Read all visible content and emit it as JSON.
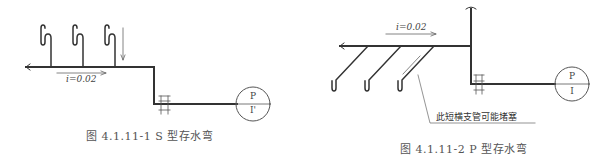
{
  "figures": [
    {
      "id": "s-trap",
      "caption": "图 4.1.11-1   S 型存水弯",
      "slope_label": "i=0.02",
      "circle_top": "P",
      "circle_bottom": "I'",
      "trap_count": 3
    },
    {
      "id": "p-trap",
      "caption": "图 4.1.11-2   P 型存水弯",
      "slope_label": "i=0.02",
      "circle_top": "P",
      "circle_bottom": "I",
      "trap_count": 3,
      "annotation": "此短横支管可能堵塞"
    }
  ],
  "colors": {
    "pipe": "#333333",
    "thin": "#555555",
    "text": "#444444"
  }
}
